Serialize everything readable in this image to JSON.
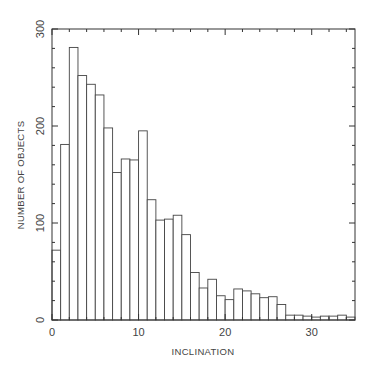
{
  "chart_data": {
    "type": "bar",
    "subtype": "histogram",
    "title": "",
    "xlabel": "INCLINATION",
    "ylabel": "NUMBER OF OBJECTS",
    "xlim": [
      0,
      35
    ],
    "ylim": [
      0,
      300
    ],
    "bin_width": 1,
    "x_ticks": [
      0,
      10,
      20,
      30
    ],
    "y_ticks": [
      0,
      100,
      200,
      300
    ],
    "grid": false,
    "legend": null,
    "bin_edges": [
      0,
      1,
      2,
      3,
      4,
      5,
      6,
      7,
      8,
      9,
      10,
      11,
      12,
      13,
      14,
      15,
      16,
      17,
      18,
      19,
      20,
      21,
      22,
      23,
      24,
      25,
      26,
      27,
      28,
      29,
      30,
      31,
      32,
      33,
      34,
      35
    ],
    "categories": [
      "0-1",
      "1-2",
      "2-3",
      "3-4",
      "4-5",
      "5-6",
      "6-7",
      "7-8",
      "8-9",
      "9-10",
      "10-11",
      "11-12",
      "12-13",
      "13-14",
      "14-15",
      "15-16",
      "16-17",
      "17-18",
      "18-19",
      "19-20",
      "20-21",
      "21-22",
      "22-23",
      "23-24",
      "24-25",
      "25-26",
      "26-27",
      "27-28",
      "28-29",
      "29-30",
      "30-31",
      "31-32",
      "32-33",
      "33-34",
      "34-35"
    ],
    "values": [
      72,
      181,
      281,
      252,
      243,
      232,
      198,
      152,
      166,
      165,
      195,
      124,
      103,
      104,
      108,
      88,
      49,
      33,
      42,
      25,
      21,
      32,
      30,
      27,
      23,
      24,
      16,
      5,
      5,
      4,
      3,
      4,
      4,
      5,
      3
    ]
  },
  "colors": {
    "axis": "#333333",
    "bar_edge": "#444444",
    "bar_fill": "#ffffff",
    "text": "#444444"
  }
}
